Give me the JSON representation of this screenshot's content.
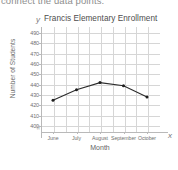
{
  "instruction": {
    "text": "connect the data points."
  },
  "chart": {
    "y_axis_letter": "y",
    "x_axis_letter": "x",
    "axis_break_symbol": "≈",
    "line_color": "#2b2b2b",
    "marker_color": "#1f1f1f",
    "grid_color": "#d6d6d6",
    "axis_color": "#b9b9b9"
  },
  "chart_data": {
    "type": "line",
    "title": "Francis Elementary Enrollment",
    "xlabel": "Month",
    "ylabel": "Number of Students",
    "categories": [
      "June",
      "July",
      "August",
      "September",
      "October"
    ],
    "values": [
      425,
      435,
      442,
      439,
      428
    ],
    "ytick_labels": [
      "490",
      "480",
      "470",
      "460",
      "450",
      "440",
      "430",
      "420",
      "410",
      "400"
    ],
    "ytick_values": [
      490,
      480,
      470,
      460,
      450,
      440,
      430,
      420,
      410,
      400
    ],
    "ylim": [
      395,
      495
    ],
    "grid": true,
    "legend": "none",
    "axis_break": true,
    "markers": true
  }
}
